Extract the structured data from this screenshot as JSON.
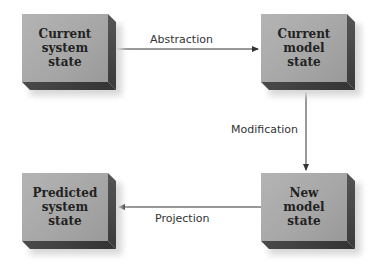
{
  "diagram": {
    "nodes": [
      {
        "id": "current-system",
        "lines": [
          "Current",
          "system",
          "state"
        ]
      },
      {
        "id": "current-model",
        "lines": [
          "Current",
          "model",
          "state"
        ]
      },
      {
        "id": "new-model",
        "lines": [
          "New",
          "model",
          "state"
        ]
      },
      {
        "id": "predicted-system",
        "lines": [
          "Predicted",
          "system",
          "state"
        ]
      }
    ],
    "edges": [
      {
        "from": "current-system",
        "to": "current-model",
        "label": "Abstraction"
      },
      {
        "from": "current-model",
        "to": "new-model",
        "label": "Modification"
      },
      {
        "from": "new-model",
        "to": "predicted-system",
        "label": "Projection"
      }
    ],
    "colors": {
      "box_face": "#a8a8a8",
      "box_side": "#3a3a3a",
      "line": "#333333"
    }
  }
}
